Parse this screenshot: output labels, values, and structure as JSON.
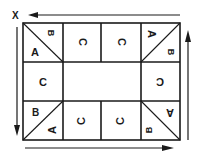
{
  "diagram": {
    "start_marker": "X",
    "colors": {
      "ink": "#1a1a1a",
      "background": "#ffffff"
    },
    "grid": {
      "rows": 3,
      "columns": 4,
      "center_block": "empty"
    },
    "cells": {
      "top_left": {
        "upper_label": "B",
        "lower_label": "A",
        "split": "diagonal"
      },
      "top_2": {
        "label": "C"
      },
      "top_3": {
        "label": "C"
      },
      "top_right": {
        "upper_label": "A",
        "lower_label": "B",
        "split": "diagonal"
      },
      "middle_left": {
        "label": "C"
      },
      "middle_right": {
        "label": "C"
      },
      "bottom_left": {
        "upper_label": "B",
        "lower_label": "A",
        "split": "diagonal"
      },
      "bottom_2": {
        "label": "C"
      },
      "bottom_3": {
        "label": "C"
      },
      "bottom_right": {
        "upper_label": "A",
        "lower_label": "B",
        "split": "diagonal"
      }
    },
    "arrows": [
      {
        "side": "top",
        "direction": "right-to-left"
      },
      {
        "side": "left",
        "direction": "top-to-bottom"
      },
      {
        "side": "bottom",
        "direction": "left-to-right"
      },
      {
        "side": "right",
        "direction": "bottom-to-top"
      }
    ]
  }
}
